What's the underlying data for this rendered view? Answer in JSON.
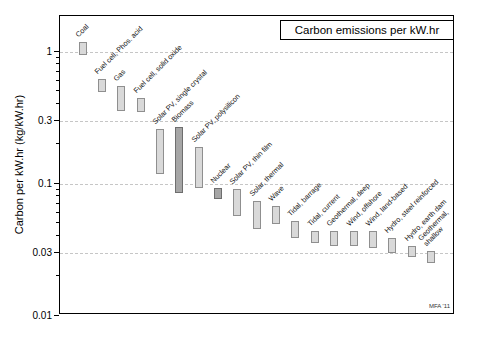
{
  "title": "Carbon emissions per kW.hr",
  "credit": "MFA '11",
  "y_axis": {
    "label": "Carbon per kW.hr (kg/kW.hr)",
    "ticks": [
      {
        "value": 1,
        "label": "1"
      },
      {
        "value": 0.3,
        "label": "0.3"
      },
      {
        "value": 0.1,
        "label": "0.1"
      },
      {
        "value": 0.03,
        "label": "0.03"
      },
      {
        "value": 0.01,
        "label": "0.01"
      }
    ],
    "minor_ticks": [
      0.9,
      0.8,
      0.7,
      0.6,
      0.5,
      0.4,
      0.2,
      0.09,
      0.08,
      0.07,
      0.06,
      0.05,
      0.04,
      0.02
    ]
  },
  "colors": {
    "bar_light_fill": "#d9d9d9",
    "bar_light_border": "#8f8f8f",
    "bar_dark_fill": "#a6a6a6",
    "bar_dark_border": "#6e6e6e",
    "grid": "#c6c6c6",
    "axis": "#000000"
  },
  "chart_data": {
    "type": "bar",
    "subtype": "floating-range-bars",
    "title": "Carbon emissions per kW.hr",
    "xlabel": "",
    "ylabel": "Carbon per kW.hr (kg/kW.hr)",
    "yscale": "log",
    "ylim": [
      0.01,
      1.9
    ],
    "grid": "horizontal dashed lines at 1, 0.3, 0.1, 0.03",
    "legend": "none",
    "bars": [
      {
        "label": "Coal",
        "low": 0.95,
        "high": 1.2,
        "tone": "light"
      },
      {
        "label": "Fuel cell, Phos. acid",
        "low": 0.5,
        "high": 0.62,
        "tone": "light"
      },
      {
        "label": "Gas",
        "low": 0.36,
        "high": 0.55,
        "tone": "light"
      },
      {
        "label": "Fuel cell, solid oxide",
        "low": 0.35,
        "high": 0.45,
        "tone": "light"
      },
      {
        "label": "Solar PV, single crystal",
        "low": 0.12,
        "high": 0.26,
        "tone": "light"
      },
      {
        "label": "Biomass",
        "low": 0.085,
        "high": 0.27,
        "tone": "dark"
      },
      {
        "label": "Solar PV, polysilicon",
        "low": 0.093,
        "high": 0.19,
        "tone": "light"
      },
      {
        "label": "Nuclear",
        "low": 0.077,
        "high": 0.093,
        "tone": "dark"
      },
      {
        "label": "Solar PV, thin film",
        "low": 0.057,
        "high": 0.092,
        "tone": "light"
      },
      {
        "label": "Solar, thermal",
        "low": 0.046,
        "high": 0.074,
        "tone": "light"
      },
      {
        "label": "Wave",
        "low": 0.05,
        "high": 0.068,
        "tone": "light"
      },
      {
        "label": "Tidal, barrage",
        "low": 0.039,
        "high": 0.052,
        "tone": "light"
      },
      {
        "label": "Tidal, current",
        "low": 0.036,
        "high": 0.044,
        "tone": "light"
      },
      {
        "label": "Geothermal, deep",
        "low": 0.034,
        "high": 0.044,
        "tone": "light"
      },
      {
        "label": "Wind, offshore",
        "low": 0.034,
        "high": 0.044,
        "tone": "light"
      },
      {
        "label": "Wind, land-based",
        "low": 0.033,
        "high": 0.044,
        "tone": "light"
      },
      {
        "label": "Hydro, steel reinforced",
        "low": 0.03,
        "high": 0.039,
        "tone": "light"
      },
      {
        "label": "Hydro, earth dam",
        "low": 0.028,
        "high": 0.034,
        "tone": "light"
      },
      {
        "label": "Geothermal,\nshallow",
        "low": 0.025,
        "high": 0.031,
        "tone": "light"
      }
    ]
  }
}
